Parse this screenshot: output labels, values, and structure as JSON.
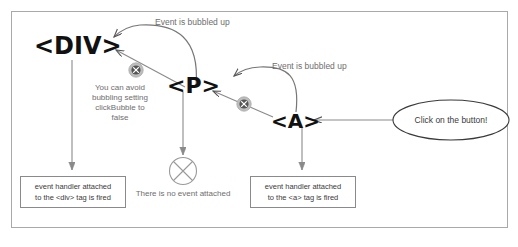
{
  "diagram": {
    "type": "event-bubbling-flow",
    "frame": {
      "border_color": "#a9a9a9",
      "background": "#ffffff"
    },
    "nodes": [
      {
        "id": "div",
        "label": "<DIV>"
      },
      {
        "id": "p",
        "label": "<P>"
      },
      {
        "id": "a",
        "label": "<A>"
      }
    ],
    "annotations": {
      "bubbled_up_1": "Event is bubbled up",
      "bubbled_up_2": "Event is bubbled up",
      "avoid_note_line1": "You can avoid",
      "avoid_note_line2": "bubbling setting",
      "avoid_note_line3": "clickBubble to",
      "avoid_note_line4": "false",
      "no_event": "There is no event attached"
    },
    "boxes": [
      {
        "id": "div-handler-box",
        "line1": "event handler attached",
        "line2": "to the <div> tag is fired"
      },
      {
        "id": "a-handler-box",
        "line1": "event handler attached",
        "line2": "to the <a> tag is fired"
      }
    ],
    "callout": {
      "id": "click-bubble",
      "text": "Click on the button!"
    },
    "colors": {
      "arrow": "#8a8a8a",
      "dark_arrow": "#555555",
      "text_gray": "#6e6e6e",
      "text_dark": "#3a3a3a",
      "tag_black": "#111111",
      "frame": "#a9a9a9",
      "block_icon": "#bdbdbd"
    },
    "caption": ""
  }
}
